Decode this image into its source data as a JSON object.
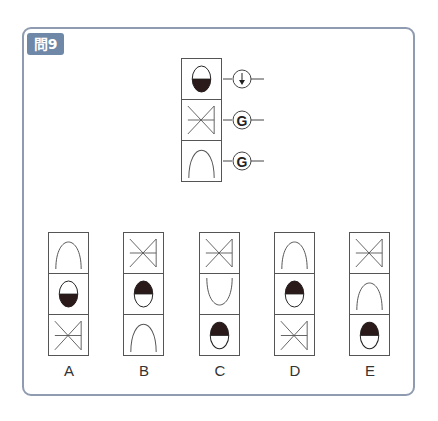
{
  "question": {
    "badge": "問9"
  },
  "problem": {
    "stack": [
      "oval-bottom-filled",
      "valve",
      "arch"
    ],
    "operators": [
      {
        "type": "arrow-down",
        "symbol": "↓"
      },
      {
        "type": "letter",
        "symbol": "G"
      },
      {
        "type": "letter",
        "symbol": "G"
      }
    ]
  },
  "options": [
    {
      "label": "A",
      "cells": [
        "arch",
        "oval-bottom-filled",
        "valve"
      ]
    },
    {
      "label": "B",
      "cells": [
        "valve",
        "oval-top-filled",
        "arch"
      ]
    },
    {
      "label": "C",
      "cells": [
        "valve",
        "u-shape",
        "oval-top-filled"
      ]
    },
    {
      "label": "D",
      "cells": [
        "arch",
        "oval-top-filled",
        "valve"
      ]
    },
    {
      "label": "E",
      "cells": [
        "valve",
        "arch",
        "oval-top-filled"
      ]
    }
  ],
  "colors": {
    "frame": "#8e9bb0",
    "badge_bg": "#6f88a8",
    "fill": "#2a1a1a",
    "line": "#555555"
  }
}
